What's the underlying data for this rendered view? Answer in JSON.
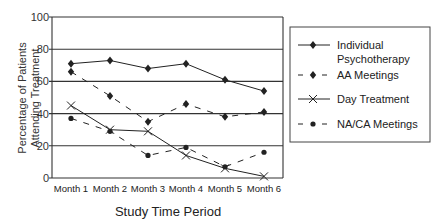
{
  "chart_data": {
    "type": "line",
    "title": "",
    "xlabel": "Study Time Period",
    "ylabel": "Percentage of Patients Attending Treatment",
    "ylabel_lines": [
      "Percentage of Patients",
      "Attending Treatment"
    ],
    "categories": [
      "Month 1",
      "Month 2",
      "Month 3",
      "Month 4",
      "Month 5",
      "Month 6"
    ],
    "ylim": [
      0,
      100
    ],
    "yticks": [
      0,
      20,
      40,
      60,
      80,
      100
    ],
    "grid": true,
    "legend_position": "right",
    "series": [
      {
        "name": "Individual Psychotherapy",
        "name_lines": [
          "Individual",
          "Psychotherapy"
        ],
        "line": "solid",
        "marker": "diamond",
        "values": [
          71,
          73,
          68,
          71,
          61,
          54
        ]
      },
      {
        "name": "AA Meetings",
        "name_lines": [
          "AA Meetings"
        ],
        "line": "dashed",
        "marker": "diamond",
        "values": [
          66,
          51,
          35,
          46,
          38,
          41
        ]
      },
      {
        "name": "Day Treatment",
        "name_lines": [
          "Day Treatment"
        ],
        "line": "solid",
        "marker": "x",
        "values": [
          45,
          30,
          29,
          14,
          6,
          1
        ]
      },
      {
        "name": "NA/CA Meetings",
        "name_lines": [
          "NA/CA Meetings"
        ],
        "line": "dashed",
        "marker": "dot",
        "values": [
          37,
          29,
          14,
          19,
          7,
          16
        ]
      }
    ]
  },
  "colors": {
    "line": "#222222",
    "grid": "#333333",
    "axis_text": "#333333"
  }
}
